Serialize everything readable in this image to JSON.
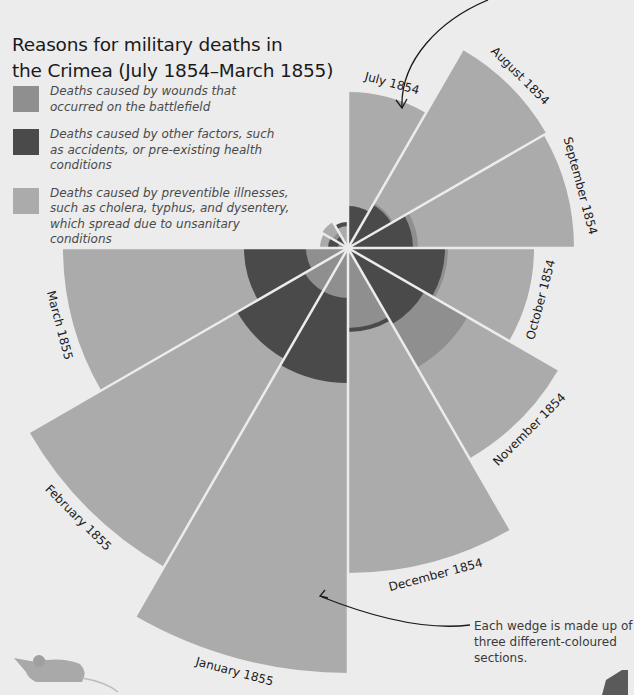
{
  "title": {
    "line1": "Reasons for military deaths in",
    "line2": "the Crimea (July 1854–March 1855)"
  },
  "legend": [
    {
      "label": "Deaths caused by wounds that occurred on the battlefield",
      "color": "#8f8f8f"
    },
    {
      "label": "Deaths caused by other factors, such as accidents, or pre-existing health conditions",
      "color": "#4a4a4a"
    },
    {
      "label": "Deaths caused by preventible illnesses, such as cholera, typhus, and dysentery, which spread due to unsanitary conditions",
      "color": "#ababab"
    }
  ],
  "annotation": {
    "text": "Each wedge is made up of three different-coloured sections."
  },
  "colors": {
    "background": "#ececec",
    "wounds": "#8f8f8f",
    "other": "#4a4a4a",
    "preventible": "#ababab",
    "divider": "#ececec"
  },
  "chart_data": {
    "type": "polar-area",
    "title": "Reasons for military deaths in the Crimea (July 1854–March 1855)",
    "categories": [
      "July 1854",
      "August 1854",
      "September 1854",
      "October 1854",
      "November 1854",
      "December 1854",
      "January 1855",
      "February 1855",
      "March 1855"
    ],
    "series": [
      {
        "name": "Deaths caused by preventible illnesses",
        "radius_px": [
          156,
          229,
          226,
          186,
          243,
          325,
          425,
          368,
          285
        ]
      },
      {
        "name": "Deaths caused by other factors",
        "radius_px": [
          42,
          50,
          65,
          97,
          88,
          84,
          135,
          128,
          104
        ]
      },
      {
        "name": "Deaths caused by wounds",
        "radius_px": [
          0,
          52,
          70,
          100,
          138,
          80,
          50,
          50,
          42
        ]
      }
    ],
    "unlabeled_small_wedges": [
      {
        "preventible": 28,
        "other": 20,
        "wounds": 10
      },
      {
        "preventible": 30,
        "other": 14,
        "wounds": 18
      },
      {
        "preventible": 22,
        "other": 26,
        "wounds": 0
      }
    ],
    "note": "Radii estimated in pixels from the figure; each wedge spans 30 degrees, area proportional to deaths",
    "annotation": "Each wedge is made up of three different-coloured sections.",
    "legend_position": "top-left"
  }
}
